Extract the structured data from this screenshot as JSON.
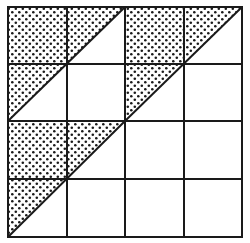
{
  "diagram": {
    "grid": {
      "rows": 4,
      "cols": 4,
      "x_lines": [
        8,
        67,
        125,
        184,
        242
      ],
      "y_lines": [
        7,
        64,
        121,
        179,
        237
      ],
      "line_color": "#1a1a1a",
      "line_width": 2
    },
    "shaded_blocks": [
      {
        "name": "top-left-block",
        "x0": 8,
        "y0": 7,
        "x1": 125,
        "y1": 121
      },
      {
        "name": "top-right-block",
        "x0": 125,
        "y0": 7,
        "x1": 242,
        "y1": 121
      },
      {
        "name": "bottom-left-block",
        "x0": 8,
        "y0": 121,
        "x1": 125,
        "y1": 237
      }
    ],
    "unshaded_blocks": [
      {
        "name": "bottom-right-block",
        "x0": 125,
        "y0": 121,
        "x1": 242,
        "y1": 237
      }
    ],
    "fill_pattern": "dots",
    "dot_color": "#1a1a1a",
    "background": "#ffffff"
  }
}
